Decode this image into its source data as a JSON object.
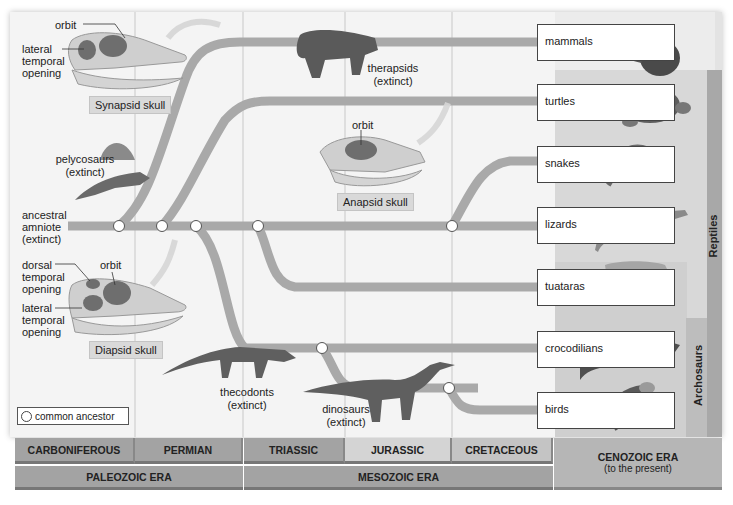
{
  "colors": {
    "panel_bg": "#f4f4f4",
    "branch": "#a9a9a9",
    "grid_line": "#c8c8c8",
    "right_band": "#dcdcdc",
    "reptiles_band": "#a8a8a8",
    "archosaurs_band": "#bdbdbd",
    "period_dark": "#9e9e9e",
    "period_light": "#d2d2d2",
    "era_bar": "#9e9e9e",
    "cenozoic": "#b5b5b5",
    "node_fill": "#ffffff"
  },
  "skulls": {
    "synapsid": {
      "label": "Synapsid skull",
      "annotations": {
        "orbit": "orbit",
        "lateral": [
          "lateral",
          "temporal",
          "opening"
        ]
      }
    },
    "anapsid": {
      "label": "Anapsid skull",
      "annotations": {
        "orbit": "orbit"
      }
    },
    "diapsid": {
      "label": "Diapsid skull",
      "annotations": {
        "dorsal": [
          "dorsal",
          "temporal",
          "opening"
        ],
        "orbit": "orbit",
        "lateral": [
          "lateral",
          "temporal",
          "opening"
        ]
      }
    }
  },
  "extinct_groups": {
    "ancestral": [
      "ancestral",
      "amniote",
      "(extinct)"
    ],
    "pelycosaurs": [
      "pelycosaurs",
      "(extinct)"
    ],
    "therapsids": [
      "therapsids",
      "(extinct)"
    ],
    "thecodonts": [
      "thecodonts",
      "(extinct)"
    ],
    "dinosaurs": [
      "dinosaurs",
      "(extinct)"
    ]
  },
  "living_taxa": [
    {
      "label": "mammals",
      "icon": "raccoon-icon"
    },
    {
      "label": "turtles",
      "icon": "turtle-icon"
    },
    {
      "label": "snakes",
      "icon": "snake-icon"
    },
    {
      "label": "lizards",
      "icon": "lizard-icon"
    },
    {
      "label": "tuataras",
      "icon": "tuatara-icon"
    },
    {
      "label": "crocodilians",
      "icon": "crocodile-icon"
    },
    {
      "label": "birds",
      "icon": "bird-icon"
    }
  ],
  "clades": {
    "reptiles": "Reptiles",
    "archosaurs": "Archosaurs"
  },
  "legend": {
    "label": "common ancestor"
  },
  "timeline": {
    "periods": [
      "CARBONIFEROUS",
      "PERMIAN",
      "TRIASSIC",
      "JURASSIC",
      "CRETACEOUS"
    ],
    "eras": [
      "PALEOZOIC ERA",
      "MESOZOIC ERA"
    ],
    "cenozoic": {
      "title": "CENOZOIC ERA",
      "subtitle": "(to the present)"
    }
  }
}
